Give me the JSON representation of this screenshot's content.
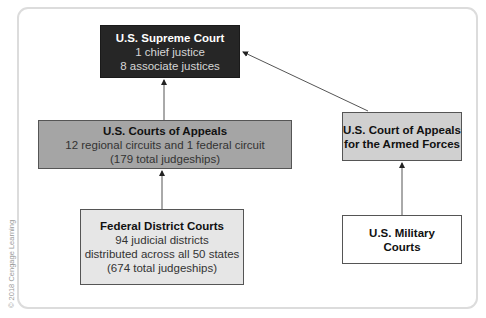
{
  "diagram": {
    "nodes": {
      "supreme": {
        "title": "U.S. Supreme Court",
        "lines": [
          "1 chief justice",
          "8 associate justices"
        ],
        "fill": "#262626"
      },
      "appeals": {
        "title": "U.S. Courts of Appeals",
        "lines": [
          "12 regional circuits and 1 federal circuit",
          "(179 total judgeships)"
        ],
        "fill": "#a5a5a5"
      },
      "armed": {
        "title_lines": [
          "U.S. Court of Appeals",
          "for the Armed Forces"
        ],
        "fill": "#d0d0d0"
      },
      "district": {
        "title": "Federal District Courts",
        "lines": [
          "94 judicial districts",
          "distributed across all 50 states",
          "(674 total judgeships)"
        ],
        "fill": "#e6e6e6"
      },
      "military": {
        "title_lines": [
          "U.S. Military",
          "Courts"
        ],
        "fill": "#ffffff"
      }
    },
    "edges": [
      {
        "from": "appeals",
        "to": "supreme"
      },
      {
        "from": "armed",
        "to": "supreme"
      },
      {
        "from": "district",
        "to": "appeals"
      },
      {
        "from": "military",
        "to": "armed"
      }
    ]
  },
  "copyright": "© 2018 Cengage Learning"
}
